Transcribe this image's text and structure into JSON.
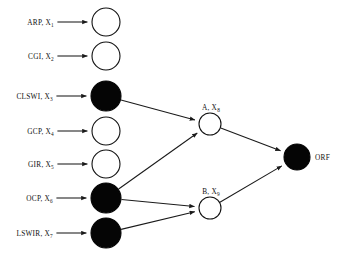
{
  "figure": {
    "type": "neural-network-diagram",
    "width": 344,
    "height": 255,
    "background_color": "#ffffff",
    "line_color": "#1a1a1a",
    "filled_node_color": "#050505",
    "open_node_color": "#ffffff"
  },
  "layers": {
    "input": {
      "name": "input-layer",
      "nodes": [
        {
          "id": "x1",
          "name": "ARP",
          "var": "X",
          "sub": "1",
          "label": "ARP, X₁",
          "text": "ARP",
          "subscript": "1",
          "cx": 106,
          "cy": 22,
          "r": 14,
          "filled": false
        },
        {
          "id": "x2",
          "name": "CGI",
          "var": "X",
          "sub": "2",
          "label": "CGI, X₂",
          "text": "CGI",
          "subscript": "2",
          "cx": 106,
          "cy": 56,
          "r": 14,
          "filled": false
        },
        {
          "id": "x3",
          "name": "CLSWI",
          "var": "X",
          "sub": "3",
          "label": "CLSWI, X₃",
          "text": "CLSWI",
          "subscript": "3",
          "cx": 106,
          "cy": 96,
          "r": 15,
          "filled": true
        },
        {
          "id": "x4",
          "name": "GCP",
          "var": "X",
          "sub": "4",
          "label": "GCP, X₄",
          "text": "GCP",
          "subscript": "4",
          "cx": 106,
          "cy": 131,
          "r": 14,
          "filled": false
        },
        {
          "id": "x5",
          "name": "GIR",
          "var": "X",
          "sub": "5",
          "label": "GIR, X₅",
          "text": "GIR",
          "subscript": "5",
          "cx": 106,
          "cy": 164,
          "r": 14,
          "filled": false
        },
        {
          "id": "x6",
          "name": "OCP",
          "var": "X",
          "sub": "6",
          "label": "OCP, X₆",
          "text": "OCP",
          "subscript": "6",
          "cx": 106,
          "cy": 198,
          "r": 15,
          "filled": true
        },
        {
          "id": "x7",
          "name": "LSWIR",
          "var": "X",
          "sub": "7",
          "label": "LSWIR, X₇",
          "text": "LSWIR",
          "subscript": "7",
          "cx": 106,
          "cy": 233,
          "r": 15,
          "filled": true
        }
      ]
    },
    "hidden": {
      "name": "hidden-layer",
      "nodes": [
        {
          "id": "a",
          "name": "A",
          "var": "X",
          "sub": "8",
          "label": "A, X₈",
          "text": "A",
          "subscript": "8",
          "cx": 210,
          "cy": 124,
          "r": 11,
          "filled": false
        },
        {
          "id": "b",
          "name": "B",
          "var": "X",
          "sub": "9",
          "label": "B, X₉",
          "text": "B",
          "subscript": "9",
          "cx": 210,
          "cy": 208,
          "r": 11,
          "filled": false
        }
      ]
    },
    "output": {
      "name": "output-layer",
      "nodes": [
        {
          "id": "orf",
          "name": "ORF",
          "label": "ORF",
          "text": "ORF",
          "subscript": "",
          "cx": 297,
          "cy": 157,
          "r": 13,
          "filled": true
        }
      ]
    }
  },
  "edges": [
    {
      "id": "e-in-x1",
      "from": "label-x1",
      "to": "x1",
      "kind": "input-arrow"
    },
    {
      "id": "e-in-x2",
      "from": "label-x2",
      "to": "x2",
      "kind": "input-arrow"
    },
    {
      "id": "e-in-x3",
      "from": "label-x3",
      "to": "x3",
      "kind": "input-arrow"
    },
    {
      "id": "e-in-x4",
      "from": "label-x4",
      "to": "x4",
      "kind": "input-arrow"
    },
    {
      "id": "e-in-x5",
      "from": "label-x5",
      "to": "x5",
      "kind": "input-arrow"
    },
    {
      "id": "e-in-x6",
      "from": "label-x6",
      "to": "x6",
      "kind": "input-arrow"
    },
    {
      "id": "e-in-x7",
      "from": "label-x7",
      "to": "x7",
      "kind": "input-arrow"
    },
    {
      "id": "e-x3-a",
      "from": "x3",
      "to": "a",
      "kind": "connection"
    },
    {
      "id": "e-x6-a",
      "from": "x6",
      "to": "a",
      "kind": "connection"
    },
    {
      "id": "e-x6-b",
      "from": "x6",
      "to": "b",
      "kind": "connection"
    },
    {
      "id": "e-x7-b",
      "from": "x7",
      "to": "b",
      "kind": "connection"
    },
    {
      "id": "e-a-orf",
      "from": "a",
      "to": "orf",
      "kind": "connection"
    },
    {
      "id": "e-b-orf",
      "from": "b",
      "to": "orf",
      "kind": "connection"
    }
  ]
}
